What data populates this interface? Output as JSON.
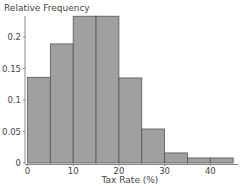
{
  "chart_data": {
    "type": "bar",
    "subtype": "histogram",
    "title": "",
    "ylabel": "Relative Frequency",
    "xlabel": "Tax Rate (%)",
    "bin_edges": [
      0,
      5,
      10,
      15,
      20,
      25,
      30,
      35,
      40,
      45
    ],
    "categories": [
      "0-5",
      "5-10",
      "10-15",
      "15-20",
      "20-25",
      "25-30",
      "30-35",
      "35-40",
      "40-45"
    ],
    "values": [
      0.136,
      0.189,
      0.233,
      0.233,
      0.135,
      0.054,
      0.016,
      0.008,
      0.008
    ],
    "xlim": [
      0,
      45
    ],
    "ylim": [
      0,
      0.235
    ],
    "xticks": [
      0,
      10,
      20,
      30,
      40
    ],
    "xtick_labels": [
      "0",
      "10",
      "20",
      "30",
      "40"
    ],
    "yticks": [
      0,
      0.05,
      0.1,
      0.15,
      0.2
    ],
    "ytick_labels": [
      "0",
      "0.05",
      "0.1",
      "0.15",
      "0.2"
    ],
    "grid": false,
    "legend": null,
    "colors": {
      "bar_fill": "#a0a0a0",
      "bar_edge": "#555555",
      "axis": "#888888",
      "text": "#444444"
    }
  }
}
